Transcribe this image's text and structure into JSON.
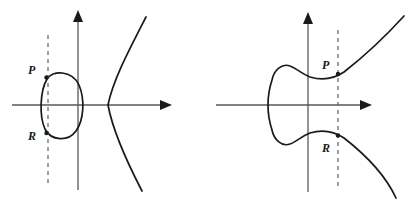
{
  "figure": {
    "width": 408,
    "height": 211,
    "background": "#ffffff",
    "curve_color": "#1a1a1a",
    "axis_color": "#59595b",
    "dashed_color": "#6d6d70"
  },
  "panels": [
    {
      "id": "left",
      "name": "left-panel",
      "description": "Ellipse crossed by a dashed vertical line, plus a separate rightward-opening parabola branch",
      "axes": {
        "x_axis": {
          "label": "",
          "y": 105,
          "x_start": 12,
          "x_end": 168,
          "arrow": "right"
        },
        "y_axis": {
          "label": "",
          "x": 78,
          "y_start": 190,
          "y_end": 13,
          "arrow": "up"
        }
      },
      "dashed_line": {
        "x": 48,
        "y_top": 35,
        "y_bottom": 185
      },
      "points": [
        {
          "label": "P",
          "x": 46,
          "y": 77,
          "label_x": 28,
          "label_y": 65
        },
        {
          "label": "R",
          "x": 46,
          "y": 133,
          "label_x": 28,
          "label_y": 131
        }
      ],
      "curves": [
        {
          "name": "oval",
          "type": "closed-oval",
          "center_x": 61,
          "center_y": 105,
          "rx": 21,
          "ry": 33
        },
        {
          "name": "parabola-branch",
          "type": "open-right",
          "vertex_x": 108,
          "vertex_y": 105,
          "top_x": 146,
          "top_y": 17,
          "bottom_x": 142,
          "bottom_y": 191
        }
      ]
    },
    {
      "id": "right",
      "name": "right-panel",
      "description": "Single connected curve: left bulb narrowing to a neck then flaring into two branches, crossed by a dashed vertical line",
      "axes": {
        "x_axis": {
          "label": "",
          "y": 105,
          "x_start": 216,
          "x_end": 372,
          "arrow": "right"
        },
        "y_axis": {
          "label": "",
          "x": 308,
          "y_start": 192,
          "y_end": 14,
          "arrow": "up"
        }
      },
      "dashed_line": {
        "x": 338,
        "y_top": 30,
        "y_bottom": 190
      },
      "points": [
        {
          "label": "P",
          "x": 338,
          "y": 75,
          "label_x": 322,
          "label_y": 60
        },
        {
          "label": "R",
          "x": 338,
          "y": 140,
          "label_x": 322,
          "label_y": 143
        }
      ],
      "curves": [
        {
          "name": "connected-cubic-curve",
          "type": "bulb-with-two-branches",
          "leftmost_x": 285,
          "leftmost_y": 105,
          "upper_end_x": 404,
          "upper_end_y": 16,
          "lower_end_x": 396,
          "lower_end_y": 198
        }
      ]
    }
  ],
  "labels": {
    "p": "P",
    "r": "R"
  }
}
